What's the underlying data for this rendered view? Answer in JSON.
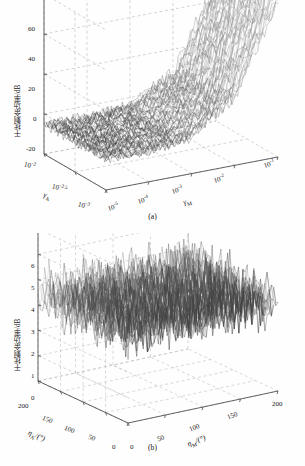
{
  "figure": {
    "background": "#ffffff",
    "grid_color": "#b9b9bd",
    "axis_color": "#4a4a4a",
    "mesh_color_dark": "#2b2b2b",
    "mesh_color_light": "#cfcfcf"
  },
  "panel_a": {
    "caption": "(a)",
    "ylabel": "干扰剩余功率/dB",
    "xlabel_left": "γ",
    "xlabel_left_sub": "A",
    "xlabel_right": "γ",
    "xlabel_right_sub": "M",
    "yticks": [
      "60",
      "40",
      "20",
      "0",
      "-20"
    ],
    "left_ticks": [
      "10",
      "10",
      "10"
    ],
    "left_tick_exps": [
      "-2",
      "-2.5",
      "-3"
    ],
    "right_ticks": [
      "10",
      "10",
      "10",
      "10",
      "10"
    ],
    "right_tick_exps": [
      "-5",
      "-4",
      "-3",
      "-2",
      "-1"
    ]
  },
  "panel_b": {
    "caption": "(b)",
    "ylabel": "干扰剩余功率/dB",
    "xlabel_left": "η",
    "xlabel_left_sub": "A",
    "xlabel_left_unit": "/(°)",
    "xlabel_right": "η",
    "xlabel_right_sub": "M",
    "xlabel_right_unit": "/(°)",
    "yticks": [
      "6",
      "5",
      "4",
      "3",
      "2",
      "1",
      "0"
    ],
    "left_ticks": [
      "200",
      "150",
      "100",
      "50",
      "0"
    ],
    "right_ticks": [
      "0",
      "50",
      "100",
      "150",
      "200"
    ]
  },
  "chart_data": [
    {
      "type": "surface",
      "panel": "a",
      "title": "",
      "xlabel": "γ_M",
      "ylabel": "γ_A",
      "zlabel": "干扰剩余功率/dB",
      "xscale": "log",
      "yscale": "log",
      "xlim": [
        1e-05,
        0.1
      ],
      "ylim": [
        0.001,
        0.01
      ],
      "zlim": [
        -20,
        60
      ],
      "xticks": [
        1e-05,
        0.0001,
        0.001,
        0.01,
        0.1
      ],
      "yticks": [
        0.01,
        0.00316,
        0.001
      ],
      "zticks": [
        -20,
        0,
        20,
        40,
        60
      ],
      "grid": true,
      "legend": null,
      "description": "Dense noisy mesh surface; residual power stays near -5 dB over most of the low gamma_M region and rises steeply to roughly 45-50 dB as gamma_M approaches 1e-1.",
      "profile_x": [
        1e-05,
        0.0001,
        0.001,
        0.01,
        0.03,
        0.1
      ],
      "profile_z": [
        -5,
        -5,
        -3,
        8,
        28,
        48
      ],
      "noise_amplitude": 4
    },
    {
      "type": "surface",
      "panel": "b",
      "title": "",
      "xlabel": "η_M/(°)",
      "ylabel": "η_A/(°)",
      "zlabel": "干扰剩余功率/dB",
      "xscale": "linear",
      "yscale": "linear",
      "xlim": [
        0,
        200
      ],
      "ylim": [
        0,
        200
      ],
      "zlim": [
        0,
        6
      ],
      "xticks": [
        0,
        50,
        100,
        150,
        200
      ],
      "yticks": [
        0,
        50,
        100,
        150,
        200
      ],
      "zticks": [
        0,
        1,
        2,
        3,
        4,
        5,
        6
      ],
      "grid": true,
      "legend": null,
      "description": "Flat noisy mesh surface, residual power fluctuating roughly between 2 and 5 dB with a mean near 3.5 dB across all angle pairs.",
      "mean_z": 3.5,
      "noise_amplitude": 1.5
    }
  ]
}
